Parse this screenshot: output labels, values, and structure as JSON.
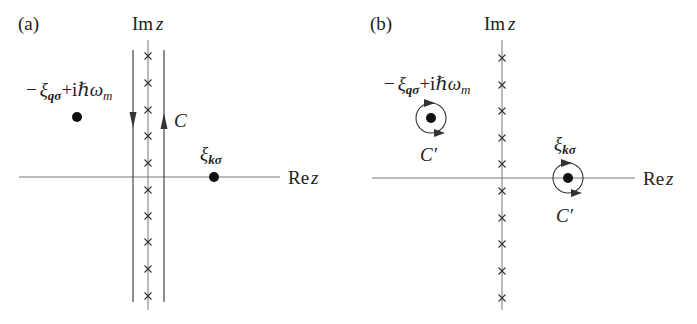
{
  "figure": {
    "panels": [
      {
        "id": "a",
        "label": "(a)",
        "im_axis": {
          "re": "Im",
          "var": "z"
        },
        "re_axis": {
          "re": "Re",
          "var": "z"
        },
        "pole_left": {
          "minus": "−",
          "xi": "ξ",
          "sub": "qσ",
          "plus": "+",
          "i": "i",
          "hbar": "ℏ",
          "omega": "ω",
          "omega_sub": "m"
        },
        "pole_right": {
          "xi": "ξ",
          "sub": "kσ"
        },
        "contour_label": "C",
        "matsubara_poles": 10
      },
      {
        "id": "b",
        "label": "(b)",
        "im_axis": {
          "re": "Im",
          "var": "z"
        },
        "re_axis": {
          "re": "Re",
          "var": "z"
        },
        "pole_left": {
          "minus": "−",
          "xi": "ξ",
          "sub": "qσ",
          "plus": "+",
          "i": "i",
          "hbar": "ℏ",
          "omega": "ω",
          "omega_sub": "m"
        },
        "pole_right": {
          "xi": "ξ",
          "sub": "kσ"
        },
        "contour_label_left": "C′",
        "contour_label_right": "C′",
        "matsubara_poles": 10
      }
    ],
    "colors": {
      "ink": "#222222",
      "axis": "#555555",
      "background": "#ffffff"
    }
  }
}
